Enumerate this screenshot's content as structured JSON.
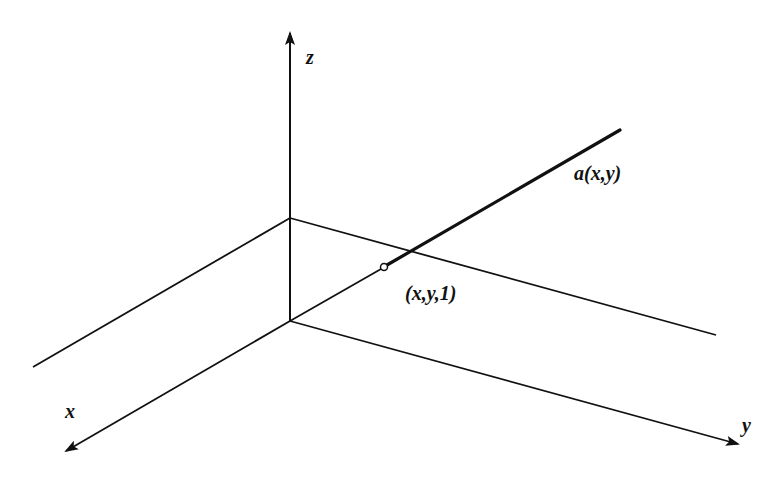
{
  "diagram": {
    "title": "",
    "stroke_color": "#111111",
    "background": "#ffffff",
    "axes": {
      "x": {
        "label": "x"
      },
      "y": {
        "label": "y"
      },
      "z": {
        "label": "z"
      }
    },
    "labels": {
      "ray": "a(x,y)",
      "point": "(x,y,1)"
    }
  }
}
